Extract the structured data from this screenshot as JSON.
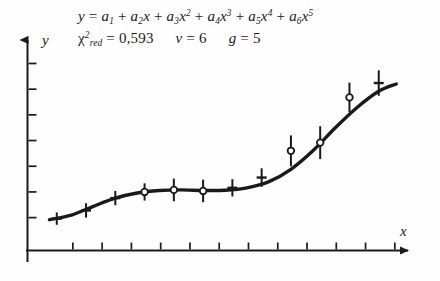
{
  "figure": {
    "background_color": "#fefefe",
    "ink_color": "#1a1a1a",
    "annotations": {
      "model_equation_plain": "y = a1 + a2x + a3x^2 + a4x^3 + a5x^4 + a6x^5",
      "statistics_plain": "chi2_red = 0,593   nu = 6   g = 5",
      "chi_symbol": "χ",
      "chi_subscript": "red",
      "chi_superscript": "2",
      "equals": "=",
      "chi_value": "0,593",
      "nu_symbol": "ν",
      "nu_value": "6",
      "g_symbol": "g",
      "g_value": "5",
      "y_symbol": "y",
      "a_symbol": "a",
      "x_symbol": "x",
      "plus": "+"
    },
    "axes": {
      "x_label": "x",
      "y_label": "y",
      "x_tick_count": 12,
      "y_tick_count": 7,
      "x_tick_labels": [],
      "y_tick_labels": [],
      "arrowheads": true,
      "grid": false
    }
  },
  "chart_data": {
    "type": "scatter",
    "title": "",
    "subtitle": "",
    "xlabel": "x",
    "ylabel": "y",
    "xlim": [
      0,
      13
    ],
    "ylim": [
      0,
      10
    ],
    "grid": false,
    "legend": false,
    "fit_model": "y = a1 + a2x + a3x^2 + a4x^3 + a5x^4 + a6x^5",
    "goodness_of_fit": {
      "chi2_reduced": 0.593,
      "degrees_of_freedom": 6,
      "number_of_parameters": 5
    },
    "series": [
      {
        "name": "measurements",
        "marker": "cross-and-open-circle",
        "x": [
          1.0,
          2.0,
          3.0,
          4.0,
          5.0,
          6.0,
          7.0,
          8.0,
          9.0,
          10.0,
          11.0,
          12.0
        ],
        "y": [
          1.55,
          1.95,
          2.55,
          2.85,
          2.95,
          2.9,
          3.05,
          3.55,
          4.85,
          5.25,
          7.45,
          8.15
        ],
        "y_err": [
          0.3,
          0.35,
          0.35,
          0.42,
          0.55,
          0.55,
          0.42,
          0.45,
          0.75,
          0.8,
          0.72,
          0.62
        ],
        "marker_style_by_point": [
          "cross",
          "cross",
          "cross",
          "circle",
          "circle",
          "circle",
          "cross",
          "cross",
          "circle",
          "circle",
          "circle",
          "cross"
        ]
      }
    ],
    "fit_curve": {
      "name": "fitted polynomial",
      "x": [
        0.75,
        1.5,
        2.25,
        3.0,
        3.75,
        4.5,
        5.25,
        6.0,
        6.75,
        7.5,
        8.25,
        9.0,
        9.75,
        10.5,
        11.25,
        12.0,
        12.6
      ],
      "y": [
        1.5,
        1.72,
        2.15,
        2.55,
        2.8,
        2.92,
        2.95,
        2.92,
        2.93,
        3.05,
        3.35,
        3.95,
        4.85,
        5.95,
        6.95,
        7.75,
        8.1
      ]
    }
  }
}
